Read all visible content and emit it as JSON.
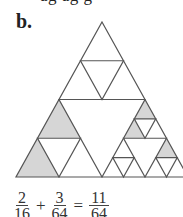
{
  "top_text_cut": "ag    ag    g",
  "figure": {
    "label": "b.",
    "outer_triangle": {
      "apex": [
        102,
        22
      ],
      "base_left": [
        16,
        177
      ],
      "base_right": [
        188,
        177
      ]
    },
    "stroke_color": "#555555",
    "shade_color": "#d6d6d6"
  },
  "equation": {
    "terms": [
      {
        "num": "2",
        "den": "16"
      },
      {
        "num": "3",
        "den": "64"
      }
    ],
    "operator": "+",
    "equals": "=",
    "result": {
      "num": "11",
      "den": "64"
    }
  }
}
